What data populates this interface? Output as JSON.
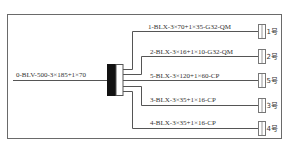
{
  "diagram": {
    "colors": {
      "line": "#555555",
      "frame": "#666666",
      "busbar_fill": "#111111",
      "text": "#333333"
    },
    "input": {
      "label": "0-BLV-500-3×185+1×70"
    },
    "branches": [
      {
        "id": "1",
        "label": "1-BLX-3×70+1×35-G32-QM",
        "terminal": "1号"
      },
      {
        "id": "2",
        "label": "2-BLX-3×16+1×10-G32-QM",
        "terminal": "2号"
      },
      {
        "id": "5",
        "label": "5-BLX-3×120+1×60-CP",
        "terminal": "5号"
      },
      {
        "id": "3",
        "label": "3-BLX-3×35+1×16-CP",
        "terminal": "3号"
      },
      {
        "id": "4",
        "label": "4-BLX-3×35+1×16-CP",
        "terminal": "4号"
      }
    ]
  }
}
